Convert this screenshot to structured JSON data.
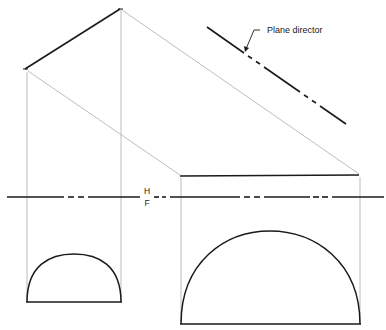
{
  "figure": {
    "type": "orthographic-projection"
  },
  "labels": {
    "plane_director": "Plane director",
    "fold_line_top": "H",
    "fold_line_bottom": "F"
  },
  "colors": {
    "object_line": "#1a1a1a",
    "projection_line": "#b5b5b5",
    "background": "#ffffff"
  },
  "geometry": {
    "top_view_edge": {
      "x1": 25,
      "y1": 69,
      "x2": 120,
      "y2": 9
    },
    "plane_director": {
      "x1": 207,
      "y1": 27,
      "x2": 346,
      "y2": 124
    },
    "auxiliary_top_edge": {
      "x1": 180,
      "y1": 176,
      "x2": 359,
      "y2": 175
    },
    "reference_line": {
      "y": 197,
      "x1": 7,
      "x2": 384
    },
    "small_semicircle": {
      "x1": 27,
      "x2": 121,
      "baseline_y": 302
    },
    "large_semicircle": {
      "x1": 181,
      "x2": 360,
      "baseline_y": 324
    }
  }
}
